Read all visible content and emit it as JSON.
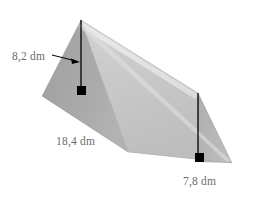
{
  "figure": {
    "name": "triangular-prism",
    "background_color": "#ffffff"
  },
  "labels": {
    "height_left": "8,2 dm",
    "length": "18,4 dm",
    "height_right": "7,8 dm",
    "text_color": "#6d6d6d"
  },
  "colors": {
    "face_left_triangle": "#a9a9a9",
    "face_left_lower": "#bdbdbd",
    "face_front_large": "#c9c9c9",
    "face_front_lower": "#bfbfbf",
    "face_bottom": "#d9d9d9",
    "face_right_end": "#b4b4b4",
    "ridge_highlight": "#e8e8e8",
    "edge_line": "#000000",
    "marker_square": "#000000"
  },
  "geometry": {
    "apex_near": {
      "x": 81,
      "y": 20
    },
    "apex_far": {
      "x": 198,
      "y": 93
    },
    "left_vertex": {
      "x": 42,
      "y": 96
    },
    "front_bottom_vertex": {
      "x": 128,
      "y": 152
    },
    "right_vertex": {
      "x": 232,
      "y": 163
    },
    "height_left_segment": {
      "x1": 81,
      "y1": 20,
      "x2": 81,
      "y2": 95
    },
    "height_right_segment": {
      "x1": 198,
      "y1": 93,
      "x2": 198,
      "y2": 162
    },
    "right_angle_marker_left": {
      "x": 81,
      "y": 90,
      "size": 9
    },
    "right_angle_marker_right": {
      "x": 199,
      "y": 157,
      "size": 9
    },
    "arrow": {
      "x1": 53,
      "y1": 55,
      "x2": 79,
      "y2": 61
    }
  }
}
